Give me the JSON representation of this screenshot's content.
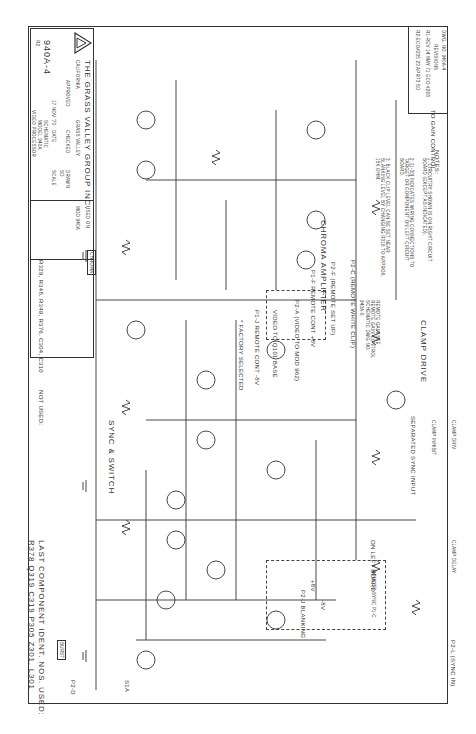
{
  "drawing": {
    "dwg_no_label": "DWG. NO. 940A-4",
    "revisions_header": "REVISIONS",
    "revisions": [
      "R1-REV 14 MAY 71 ECO #268",
      "R2-ECO#235 23 APR73 SD"
    ],
    "notes_title": "NOTES:",
    "notes": [
      "1. CIRCUITRY SHOWN IS ON RIGHT CIRCUIT BOARD (EXCEPT AS INDICATED).",
      "2. [1-30] INDICATES WIRING CONNECTIONS TO TARGET OR COMPONENT ON LEFT CIRCUIT BOARD.",
      "3. BLACK CLIP LEVEL CAN BE SET NEAR BLANKING LEVEL BY CHANGING R316 TO APPROX. 15K OHM."
    ],
    "factory_selected": "* FACTORY SELECTED"
  },
  "sections": {
    "chroma_amplifier": "CHROMA AMPLIFIER",
    "clamp_drive": "CLAMP DRIVE",
    "sync_switch": "SYNC & SWITCH",
    "on_left_board": "ON LEFT BOARD",
    "remote_gain": "REMOTE GAIN SEE REMOTE GAIN CONTROL SCHEMATIC DWG NO. 940A-6",
    "remote_sync": "REMOTE SYNC P1-C",
    "separated_sync": "SEPARATED SYNC INPUT",
    "separated_sync_tag": "1-30"
  },
  "signals": {
    "to_gain_control": "TO GAIN CONTROL",
    "p2c": "P2-C (REMOTE WHITE CLIP)",
    "p2f": "P2-F (REMOTE SET UP)",
    "p1f": "P1-F REMOTE CONT +8V",
    "p2a": "P2-A (VIDEO TO MOD 962)",
    "video_to_q101": "VIDEO TO Q101 BASE",
    "p1j": "P1-J REMOTE CONT -8V",
    "p2l": "P2-L (SYNC IN)",
    "p2j": "P2-J BLANKING",
    "p2d": "P2-D",
    "burst": "BURST",
    "s1a": "S1A",
    "chroma_tag": "CHROMA",
    "clamp_inhibit": "CLAMP INHIBIT",
    "clamp_drive": "CLAMP DRIV",
    "clamp_delay": "CLAMP DELAY",
    "video_tag": "VIDEO",
    "plus8v": "+8V",
    "minus8v": "-8V"
  },
  "components": {
    "transistors": [
      "Q301 2N4126",
      "Q302 2N4124",
      "Q303 2N4124",
      "Q304 2N4124",
      "Q305 2N4126",
      "Q306 2N4124",
      "Q307 2N4126",
      "Q308 2N4124",
      "Q309 2N4124",
      "Q310 2N4126",
      "Q311 2N4124",
      "Q312 2N4126",
      "Q313 2N4124",
      "Q314 2N4124",
      "Q315 2N4126",
      "Q316 2N4124",
      "Q317 2N4124",
      "Q318 2N4124"
    ],
    "resistor_samples": [
      "R340 47K",
      "R341 22K",
      "R342 *",
      "R343 5.6K",
      "R344 2200",
      "R345 1.8K",
      "R346 8.2K",
      "R347 3300",
      "R350 390",
      "R351 150",
      "R352 1K",
      "R353 330",
      "R354 15Ω",
      "R355 4700",
      "R356 1000",
      "R372 47K",
      "R374 180",
      "R375 100",
      "R391 100K",
      "R393 270",
      "R394 470"
    ],
    "capacitors": [
      "C306 .0047",
      "C308 .0047",
      "C311 2-8PF",
      "C312 50PF",
      "C314 .01",
      "C315 2-8PF",
      "C318 1000PF",
      "C319 .01",
      "C302 40/10",
      "C307 27PF",
      "C306 .01"
    ],
    "inductors": [
      "L301 22µH"
    ],
    "diodes": [
      "D302 1N4148(2)",
      "D303",
      "CR301 1N4148",
      "D301 1N4148",
      "Z301 1N751A"
    ]
  },
  "title_block": {
    "company": "THE GRASS VALLEY GROUP INC.",
    "city": "GRASS VALLEY",
    "state": "CALIFORNIA",
    "used_on_label": "USED ON",
    "used_on": "MOD 940A",
    "drawn_label": "DRAWN",
    "drawn": "SD",
    "checked_label": "CHECKED",
    "approved_label": "APPROVED",
    "scale_label": "SCALE",
    "scale": "~",
    "date_label": "DATE",
    "date": "17 NOV '70",
    "title": [
      "SCHEMATIC",
      "MODEL 940A",
      "VIDEO PROCESSOR",
      "BOARD (RIGHT)"
    ],
    "dwg_number": "940A-4",
    "revision": "R2",
    "logo": "gvg-triangle-logo"
  },
  "footer": {
    "last_component": "LAST COMPONENT IDENT. NOS. USED:",
    "last_list": "R378  Q319  C319  P305  Z301, L301",
    "not_used_label": "NOT USED:",
    "not_used_list": "R329, R348, R349, R376, C304, C310"
  }
}
